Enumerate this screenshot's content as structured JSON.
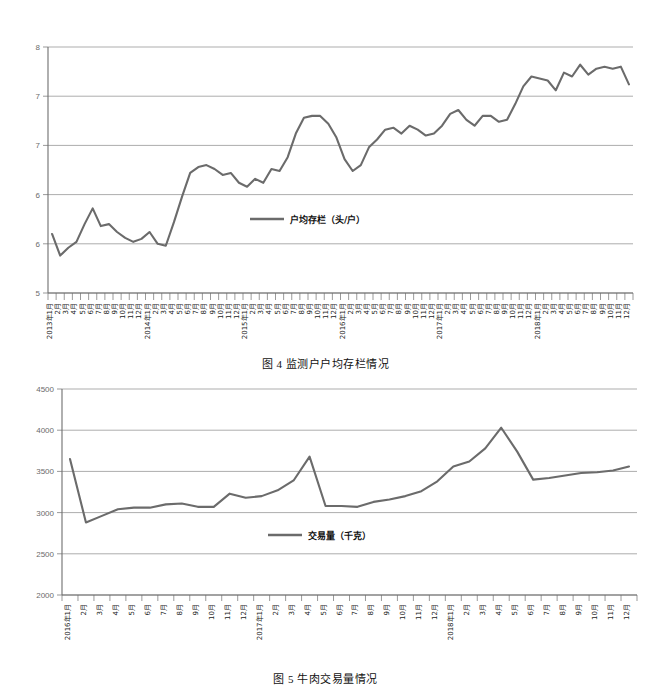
{
  "figures": [
    {
      "id": "figure-4",
      "caption": "图 4  监测户户均存栏情况",
      "legend_label": "户均存栏（头/户）",
      "series_color": "#6b6b6b",
      "chart_data": {
        "type": "line",
        "title": "监测户户均存栏情况",
        "xlabel": "",
        "ylabel": "",
        "ylim": [
          5.5,
          8
        ],
        "yticks": [
          8,
          7.5,
          7,
          6.5,
          6,
          5.5
        ],
        "grid": true,
        "legend_position": "center",
        "legend": [
          "户均存栏（头/户）"
        ],
        "categories": [
          "2013年1月",
          "2月",
          "3月",
          "4月",
          "5月",
          "6月",
          "7月",
          "8月",
          "9月",
          "10月",
          "11月",
          "12月",
          "2014年1月",
          "2月",
          "3月",
          "4月",
          "5月",
          "6月",
          "7月",
          "8月",
          "9月",
          "10月",
          "11月",
          "12月",
          "2015年1月",
          "2月",
          "3月",
          "4月",
          "5月",
          "6月",
          "7月",
          "8月",
          "9月",
          "10月",
          "11月",
          "12月",
          "2016年1月",
          "2月",
          "3月",
          "4月",
          "5月",
          "6月",
          "7月",
          "8月",
          "9月",
          "10月",
          "11月",
          "12月",
          "2017年1月",
          "2月",
          "3月",
          "4月",
          "5月",
          "6月",
          "7月",
          "8月",
          "9月",
          "10月",
          "11月",
          "12月",
          "2018年1月",
          "2月",
          "3月",
          "4月",
          "5月",
          "6月",
          "7月",
          "8月",
          "9月",
          "10月",
          "11月",
          "12月"
        ],
        "values": [
          6.1,
          5.88,
          5.96,
          6.02,
          6.2,
          6.36,
          6.18,
          6.2,
          6.12,
          6.06,
          6.02,
          6.05,
          6.12,
          6.0,
          5.98,
          6.22,
          6.48,
          6.72,
          6.78,
          6.8,
          6.76,
          6.7,
          6.72,
          6.62,
          6.58,
          6.66,
          6.62,
          6.76,
          6.74,
          6.88,
          7.12,
          7.28,
          7.3,
          7.3,
          7.22,
          7.08,
          6.86,
          6.74,
          6.8,
          6.98,
          7.06,
          7.16,
          7.18,
          7.12,
          7.2,
          7.16,
          7.1,
          7.12,
          7.2,
          7.32,
          7.36,
          7.26,
          7.2,
          7.3,
          7.3,
          7.24,
          7.26,
          7.42,
          7.6,
          7.7,
          7.68,
          7.66,
          7.56,
          7.74,
          7.7,
          7.82,
          7.72,
          7.78,
          7.8,
          7.78,
          7.8,
          7.62
        ]
      }
    },
    {
      "id": "figure-5",
      "caption": "图 5  牛肉交易量情况",
      "legend_label": "交易量（千克）",
      "series_color": "#6b6b6b",
      "chart_data": {
        "type": "line",
        "title": "牛肉交易量情况",
        "xlabel": "",
        "ylabel": "",
        "ylim": [
          2000,
          4500
        ],
        "yticks": [
          4500,
          4000,
          3500,
          3000,
          2500,
          2000
        ],
        "grid": true,
        "legend_position": "center",
        "legend": [
          "交易量（千克）"
        ],
        "categories": [
          "2016年1月",
          "2月",
          "3月",
          "4月",
          "5月",
          "6月",
          "7月",
          "8月",
          "9月",
          "10月",
          "11月",
          "12月",
          "2017年1月",
          "2月",
          "3月",
          "4月",
          "5月",
          "6月",
          "7月",
          "8月",
          "9月",
          "10月",
          "11月",
          "12月",
          "2018年1月",
          "2月",
          "3月",
          "4月",
          "5月",
          "6月",
          "7月",
          "8月",
          "9月",
          "10月",
          "11月",
          "12月"
        ],
        "values": [
          3650,
          2880,
          2960,
          3040,
          3060,
          3060,
          3100,
          3110,
          3070,
          3070,
          3230,
          3180,
          3200,
          3270,
          3390,
          3680,
          3080,
          3080,
          3070,
          3130,
          3160,
          3200,
          3260,
          3380,
          3560,
          3620,
          3780,
          4030,
          3740,
          3400,
          3420,
          3450,
          3480,
          3490,
          3510,
          3560,
          3720,
          3960,
          3960,
          3940,
          3930,
          3890
        ]
      }
    }
  ]
}
